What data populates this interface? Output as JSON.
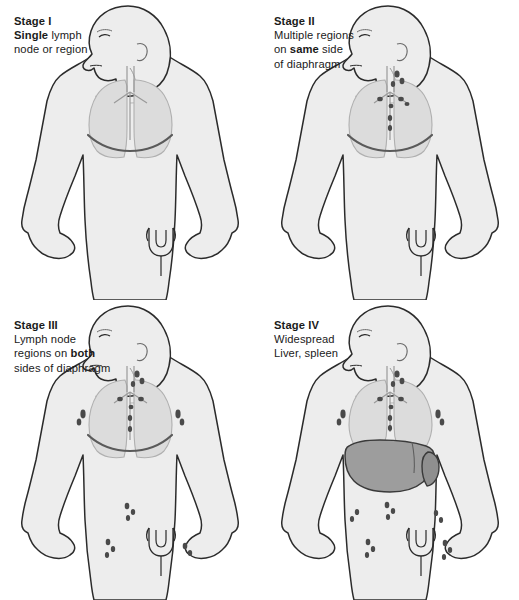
{
  "figure": {
    "panel_count": 4,
    "background_color": "#ffffff"
  },
  "palette": {
    "outline": "#2b2b2b",
    "body_fill": "#ededed",
    "body_shadow": "#e0e0e0",
    "organ_light": "#dcdcdc",
    "organ_mid": "#cccccc",
    "liver_fill": "#9d9d9d",
    "spleen_fill": "#8f8f8f",
    "node_dark": "#4a4a4a",
    "diaphragm_line": "#5a5a5a",
    "text": "#1a1a1a"
  },
  "panels": [
    {
      "id": "stage-1",
      "stage_label": "Stage I",
      "caption_lines": [
        {
          "bold_prefix": "",
          "bold_word": "",
          "text": ""
        }
      ],
      "caption": {
        "line1_bold": "Stage I",
        "line2_bold": "Single",
        "line2_rest": " lymph",
        "line3": "node or region"
      },
      "features": {
        "lungs": true,
        "diaphragm": true,
        "bladder": true,
        "liver": false,
        "spleen": false,
        "nodes_cervical": false,
        "nodes_axillary": false,
        "nodes_mediastinal": false,
        "nodes_para_aortic": false,
        "nodes_inguinal": false
      }
    },
    {
      "id": "stage-2",
      "stage_label": "Stage II",
      "caption": {
        "line1_bold": "Stage II",
        "line2": "Multiple regions",
        "line3_pre": "on ",
        "line3_bold": "same",
        "line3_post": " side",
        "line4": "of diaphragm"
      },
      "features": {
        "lungs": true,
        "diaphragm": true,
        "bladder": true,
        "liver": false,
        "spleen": false,
        "nodes_cervical": true,
        "nodes_axillary": false,
        "nodes_mediastinal": true,
        "nodes_para_aortic": false,
        "nodes_inguinal": false
      }
    },
    {
      "id": "stage-3",
      "stage_label": "Stage III",
      "caption": {
        "line1_bold": "Stage III",
        "line2": "Lymph node",
        "line3_pre": "regions on ",
        "line3_bold": "both",
        "line4": "sides of diaphragm"
      },
      "features": {
        "lungs": true,
        "diaphragm": true,
        "bladder": true,
        "liver": false,
        "spleen": false,
        "nodes_cervical": true,
        "nodes_axillary": true,
        "nodes_mediastinal": true,
        "nodes_para_aortic": true,
        "nodes_inguinal": true
      }
    },
    {
      "id": "stage-4",
      "stage_label": "Stage IV",
      "caption": {
        "line1_bold": "Stage IV",
        "line2": "Widespread",
        "line3": "Liver, spleen"
      },
      "features": {
        "lungs": true,
        "diaphragm": true,
        "bladder": true,
        "liver": true,
        "spleen": true,
        "nodes_cervical": true,
        "nodes_axillary": true,
        "nodes_mediastinal": true,
        "nodes_para_aortic": true,
        "nodes_inguinal": true
      }
    }
  ]
}
